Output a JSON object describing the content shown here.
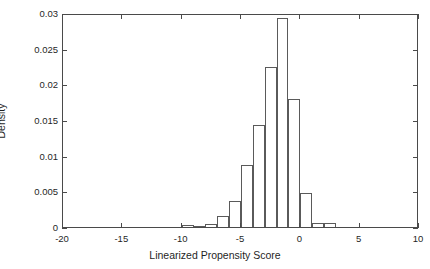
{
  "chart_data": {
    "type": "bar",
    "title": "",
    "subtitle": "",
    "xlabel": "Linearized Propensity Score",
    "ylabel": "Density",
    "xlim": [
      -20,
      10
    ],
    "ylim": [
      0,
      0.03
    ],
    "grid": false,
    "legend": null,
    "bin_width": 1,
    "bin_edges": [
      -10,
      -9,
      -8,
      -7,
      -6,
      -5,
      -4,
      -3,
      -2,
      -1,
      0,
      1,
      2,
      3
    ],
    "categories": [
      "-10 to -9",
      "-9 to -8",
      "-8 to -7",
      "-7 to -6",
      "-6 to -5",
      "-5 to -4",
      "-4 to -3",
      "-3 to -2",
      "-2 to -1",
      "-1 to 0",
      "0 to 1",
      "1 to 2",
      "2 to 3"
    ],
    "values": [
      0.0003,
      0.0002,
      0.0004,
      0.0016,
      0.0036,
      0.0087,
      0.0143,
      0.0225,
      0.0293,
      0.0179,
      0.0048,
      0.0005,
      0.0005
    ],
    "xticks": [
      -20,
      -15,
      -10,
      -5,
      0,
      5,
      10
    ],
    "xticklabels": [
      "-20",
      "-15",
      "-10",
      "-5",
      "0",
      "5",
      "10"
    ],
    "yticks": [
      0,
      0.005,
      0.01,
      0.015,
      0.02,
      0.025,
      0.03
    ],
    "yticklabels": [
      "0",
      "0.005",
      "0.01",
      "0.015",
      "0.02",
      "0.025",
      "0.03"
    ],
    "colors": {
      "bar_edge": "#5a5a5a",
      "bar_fill": "transparent",
      "axis": "#4a4a4a",
      "text": "#1f1f1f",
      "background": "#ffffff"
    }
  }
}
